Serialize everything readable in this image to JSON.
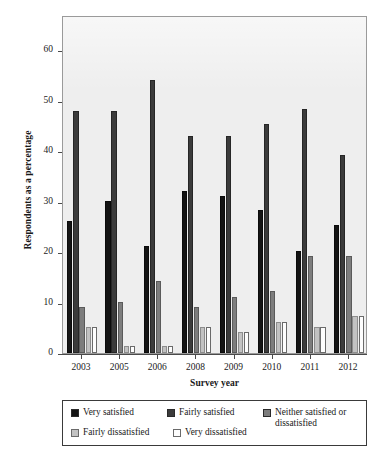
{
  "chart_data": {
    "type": "bar",
    "title": "",
    "subtitle": "",
    "xlabel": "Survey year",
    "ylabel": "Respondents as a percentage",
    "categories": [
      "2003",
      "2005",
      "2006",
      "2008",
      "2009",
      "2010",
      "2011",
      "2012"
    ],
    "ylim": [
      0,
      67
    ],
    "yticks": [
      0,
      10,
      20,
      30,
      40,
      50,
      60
    ],
    "ytick_labels": [
      "0",
      "10",
      "20",
      "30",
      "40",
      "50",
      "60"
    ],
    "grid": false,
    "legend_position": "below-plot",
    "orientation": "vertical",
    "grouping": "clustered",
    "series": [
      {
        "name": "Very satisfied",
        "color": "#141414",
        "values": [
          26.2,
          30.2,
          21.2,
          32.2,
          31.2,
          28.4,
          20.3,
          25.3
        ]
      },
      {
        "name": "Fairly satisfied",
        "color": "#3b3b3b",
        "values": [
          48.0,
          48.0,
          54.1,
          43.1,
          43.1,
          45.3,
          48.3,
          39.2
        ]
      },
      {
        "name": "Neither satisfied or dissatisfied",
        "color": "#7d7d7d",
        "values": [
          9.2,
          10.2,
          14.2,
          9.2,
          11.2,
          12.3,
          19.2,
          19.3
        ]
      },
      {
        "name": "Fairly dissatisfied",
        "color": "#c2c2c2",
        "values": [
          5.1,
          1.3,
          1.3,
          5.1,
          4.1,
          6.2,
          5.2,
          7.3
        ]
      },
      {
        "name": "Very dissatisfied",
        "color": "#fdfdfd",
        "values": [
          5.1,
          1.3,
          1.3,
          5.1,
          4.1,
          6.2,
          5.2,
          7.3
        ]
      }
    ]
  },
  "axes": {
    "y_title": "Respondents as a percentage",
    "x_title": "Survey year"
  },
  "legend": {
    "entries": [
      {
        "label": "Very satisfied",
        "swatch": "#141414"
      },
      {
        "label": "Fairly satisfied",
        "swatch": "#3b3b3b"
      },
      {
        "label": "Neither satisfied or dissatisfied",
        "swatch": "#7d7d7d"
      },
      {
        "label": "Fairly dissatisfied",
        "swatch": "#c2c2c2"
      },
      {
        "label": "Very dissatisfied",
        "swatch": "#fdfdfd"
      }
    ]
  },
  "style": {
    "plot_background": "#eeeeee",
    "plot_border": "#9a9a9a",
    "page_background": "#ffffff"
  }
}
